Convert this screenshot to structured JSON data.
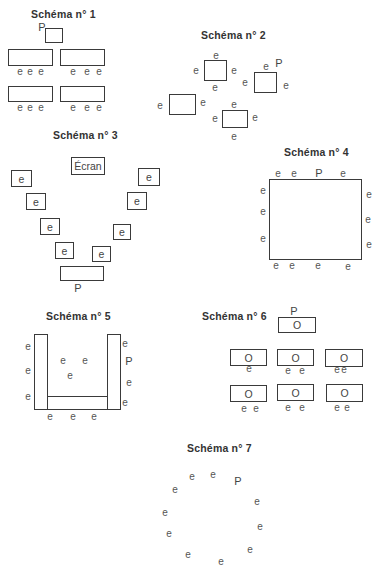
{
  "labels": {
    "student": "e",
    "teacher": "P",
    "screen": "Écran",
    "seat": "O"
  },
  "schemas": [
    {
      "id": 1,
      "title": "Schéma n°  1"
    },
    {
      "id": 2,
      "title": "Schéma n°  2"
    },
    {
      "id": 3,
      "title": "Schéma n°  3"
    },
    {
      "id": 4,
      "title": "Schéma n°  4"
    },
    {
      "id": 5,
      "title": "Schéma n°  5"
    },
    {
      "id": 6,
      "title": "Schéma n°  6"
    },
    {
      "id": 7,
      "title": "Schéma n°  7"
    }
  ]
}
